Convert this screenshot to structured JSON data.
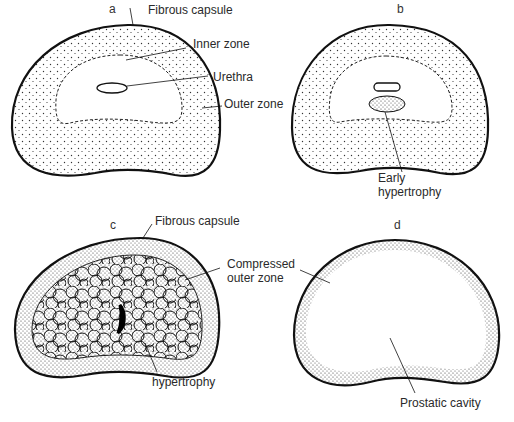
{
  "figure": {
    "panels": [
      {
        "id": "a",
        "letter": "a",
        "labels": {
          "capsule": "Fibrous capsule",
          "inner": "Inner zone",
          "urethra": "Urethra",
          "outer": "Outer zone"
        }
      },
      {
        "id": "b",
        "letter": "b",
        "labels": {
          "hypertrophy_line1": "Early",
          "hypertrophy_line2": "hypertrophy"
        }
      },
      {
        "id": "c",
        "letter": "c",
        "labels": {
          "capsule": "Fibrous capsule",
          "compressed_line1": "Compressed",
          "compressed_line2": "outer zone",
          "hypertrophy": "hypertrophy"
        }
      },
      {
        "id": "d",
        "letter": "d",
        "labels": {
          "cavity": "Prostatic cavity"
        }
      }
    ]
  }
}
